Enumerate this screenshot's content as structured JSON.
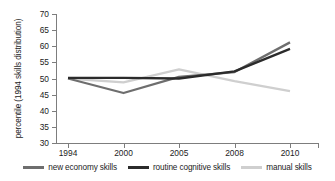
{
  "chart_data": {
    "type": "line",
    "title": "",
    "xlabel": "",
    "ylabel": "percentile (1994 skills distribution)",
    "categories": [
      "1994",
      "2000",
      "2005",
      "2008",
      "2010"
    ],
    "x": [
      1994,
      2000,
      2005,
      2008,
      2010
    ],
    "ylim": [
      30,
      70
    ],
    "yticks": [
      30,
      35,
      40,
      45,
      50,
      55,
      60,
      65,
      70
    ],
    "grid": false,
    "legend_position": "bottom",
    "series": [
      {
        "name": "new economy skills",
        "color": "#6e6e6e",
        "values": [
          50.0,
          45.5,
          50.5,
          52.0,
          61.2
        ]
      },
      {
        "name": "routine cognitive skills",
        "color": "#2b2b2b",
        "values": [
          50.2,
          50.2,
          50.0,
          52.2,
          59.2
        ]
      },
      {
        "name": "manual skills",
        "color": "#cfcfcf",
        "values": [
          50.0,
          48.8,
          52.8,
          49.2,
          46.1
        ]
      }
    ]
  },
  "axis": {
    "ytick_labels": [
      "70",
      "65",
      "60",
      "55",
      "50",
      "45",
      "40",
      "35",
      "30"
    ],
    "xtick_labels": [
      "1994",
      "2000",
      "2005",
      "2008",
      "2010"
    ],
    "ylabel": "percentile (1994 skills distribution)"
  },
  "legend": {
    "items": [
      {
        "label": "new economy skills",
        "color": "#6e6e6e"
      },
      {
        "label": "routine cognitive skills",
        "color": "#2b2b2b"
      },
      {
        "label": "manual skills",
        "color": "#cfcfcf"
      }
    ]
  },
  "colors": {
    "axis": "#7d7d7d",
    "text": "#1c1c1c",
    "background": "#ffffff",
    "new_economy": "#6e6e6e",
    "routine_cognitive": "#2b2b2b",
    "manual": "#cfcfcf"
  }
}
